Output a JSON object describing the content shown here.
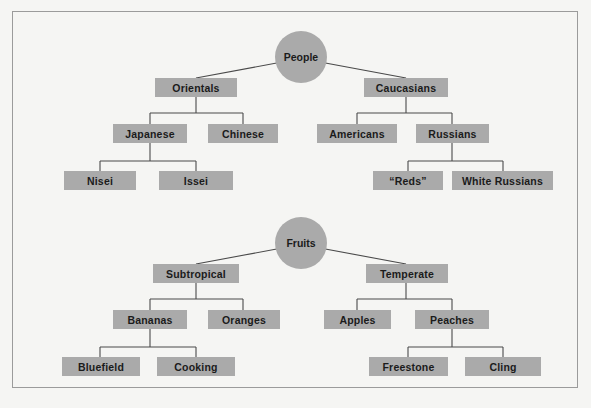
{
  "figure": {
    "background_color": "#f5f5f3",
    "frame_color": "#9b9b9b",
    "node_fill": "#aaaaaa",
    "text_color": "#1b1b1b",
    "line_color": "#4a4a4a"
  },
  "diagram": {
    "type": "hierarchy-tree",
    "trees": [
      {
        "root": "People",
        "nodes": [
          {
            "label": "Orientals",
            "level": 1
          },
          {
            "label": "Caucasians",
            "level": 1
          },
          {
            "label": "Japanese",
            "level": 2
          },
          {
            "label": "Chinese",
            "level": 2
          },
          {
            "label": "Americans",
            "level": 2
          },
          {
            "label": "Russians",
            "level": 2
          },
          {
            "label": "Nisei",
            "level": 3
          },
          {
            "label": "Issei",
            "level": 3
          },
          {
            "label": "“Reds”",
            "level": 3
          },
          {
            "label": "White Russians",
            "level": 3
          }
        ]
      },
      {
        "root": "Fruits",
        "nodes": [
          {
            "label": "Subtropical",
            "level": 1
          },
          {
            "label": "Temperate",
            "level": 1
          },
          {
            "label": "Bananas",
            "level": 2
          },
          {
            "label": "Oranges",
            "level": 2
          },
          {
            "label": "Apples",
            "level": 2
          },
          {
            "label": "Peaches",
            "level": 2
          },
          {
            "label": "Bluefield",
            "level": 3
          },
          {
            "label": "Cooking",
            "level": 3
          },
          {
            "label": "Freestone",
            "level": 3
          },
          {
            "label": "Cling",
            "level": 3
          }
        ]
      }
    ],
    "labels": {
      "people_root": "People",
      "orientals": "Orientals",
      "caucasians": "Caucasians",
      "japanese": "Japanese",
      "chinese": "Chinese",
      "americans": "Americans",
      "russians": "Russians",
      "nisei": "Nisei",
      "issei": "Issei",
      "reds": "“Reds”",
      "white_russians": "White Russians",
      "fruits_root": "Fruits",
      "subtropical": "Subtropical",
      "temperate": "Temperate",
      "bananas": "Bananas",
      "oranges": "Oranges",
      "apples": "Apples",
      "peaches": "Peaches",
      "bluefield": "Bluefield",
      "cooking": "Cooking",
      "freestone": "Freestone",
      "cling": "Cling"
    }
  }
}
